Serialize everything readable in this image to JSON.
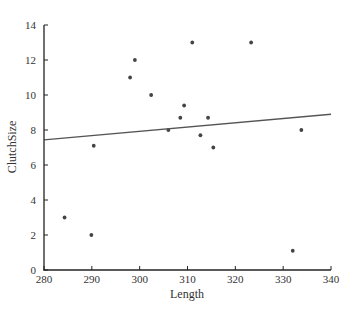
{
  "chart_data": {
    "type": "scatter",
    "title": "",
    "xlabel": "Length",
    "ylabel": "ClutchSize",
    "xlim": [
      280,
      340
    ],
    "ylim": [
      0,
      14
    ],
    "xticks": [
      280,
      290,
      300,
      310,
      320,
      330,
      340
    ],
    "yticks": [
      0,
      2,
      4,
      6,
      8,
      10,
      12,
      14
    ],
    "grid": false,
    "legend": null,
    "series": [
      {
        "name": "ClutchSize vs Length",
        "type": "scatter",
        "points": [
          {
            "x": 284.3,
            "y": 3
          },
          {
            "x": 289.9,
            "y": 2
          },
          {
            "x": 290.4,
            "y": 7.1
          },
          {
            "x": 298,
            "y": 11
          },
          {
            "x": 299,
            "y": 12
          },
          {
            "x": 302.4,
            "y": 10
          },
          {
            "x": 306,
            "y": 8
          },
          {
            "x": 308.5,
            "y": 8.7
          },
          {
            "x": 309.3,
            "y": 9.4
          },
          {
            "x": 311,
            "y": 13
          },
          {
            "x": 312.7,
            "y": 7.7
          },
          {
            "x": 314.3,
            "y": 8.7
          },
          {
            "x": 315.4,
            "y": 7
          },
          {
            "x": 323.3,
            "y": 13
          },
          {
            "x": 332,
            "y": 1.1
          },
          {
            "x": 333.8,
            "y": 8
          }
        ]
      },
      {
        "name": "Fitted line",
        "type": "line",
        "points": [
          {
            "x": 280,
            "y": 7.43
          },
          {
            "x": 340,
            "y": 8.9
          }
        ]
      }
    ],
    "colors": {
      "points": "#444444",
      "line": "#555555",
      "axis": "#222222"
    }
  }
}
